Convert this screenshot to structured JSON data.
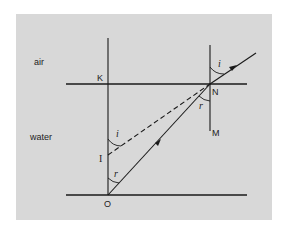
{
  "diagram": {
    "regions": {
      "air": "air",
      "water": "water"
    },
    "points": {
      "K": "K",
      "N": "N",
      "M": "M",
      "I": "I",
      "O": "O"
    },
    "angles": {
      "incidence": "i",
      "refraction": "r"
    },
    "colors": {
      "background": "#ffffff",
      "panel": "#d8d8d8",
      "line": "#1a1a1a"
    }
  }
}
